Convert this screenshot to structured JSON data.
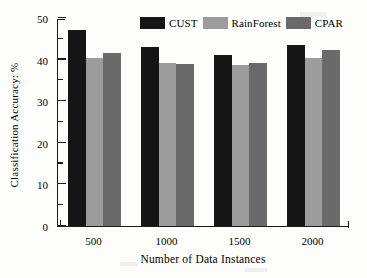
{
  "chart_data": {
    "type": "bar",
    "title": "",
    "xlabel": "Number of Data Instances",
    "ylabel": "Classification Accuracy: %",
    "categories": [
      "500",
      "1000",
      "1500",
      "2000"
    ],
    "ylim": [
      0,
      50
    ],
    "yticks": [
      0,
      10,
      20,
      30,
      40,
      50
    ],
    "yminorticks": [
      5,
      15,
      25,
      35,
      45
    ],
    "grid": false,
    "legend_position": "top-center",
    "series": [
      {
        "name": "CUST",
        "color": "#151515",
        "values": [
          47.1,
          43.0,
          41.0,
          43.4
        ]
      },
      {
        "name": "RainForest",
        "color": "#9c9c9c",
        "values": [
          40.3,
          39.1,
          38.6,
          40.4
        ]
      },
      {
        "name": "CPAR",
        "color": "#6a6a6a",
        "values": [
          41.6,
          38.9,
          39.1,
          42.3
        ]
      }
    ]
  },
  "legend": {
    "entries": [
      {
        "label": "CUST"
      },
      {
        "label": "RainForest"
      },
      {
        "label": "CPAR"
      }
    ]
  },
  "axes": {
    "y_tick_labels": [
      "0",
      "10",
      "20",
      "30",
      "40",
      "50"
    ],
    "x_tick_labels": [
      "500",
      "1000",
      "1500",
      "2000"
    ],
    "y_axis_title": "Classification Accuracy: %",
    "x_axis_title": "Number of Data Instances"
  }
}
